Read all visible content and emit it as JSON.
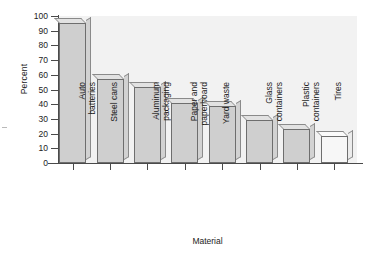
{
  "chart_data": {
    "type": "bar",
    "title": "",
    "subtitle": "",
    "xlabel": "Material",
    "ylabel": "Percent",
    "categories": [
      "Auto batteries",
      "Steel cans",
      "Aluminum packaging",
      "Paper and paperboard",
      "Yard waste",
      "Glass containers",
      "Plastic containers",
      "Tires"
    ],
    "category_lines": [
      [
        "Auto",
        "batteries"
      ],
      [
        "Steel cans"
      ],
      [
        "Aluminum",
        "packaging"
      ],
      [
        "Paper and",
        "paperboard"
      ],
      [
        "Yard waste"
      ],
      [
        "Glass",
        "containers"
      ],
      [
        "Plastic",
        "containers"
      ],
      [
        "Tires"
      ]
    ],
    "values": [
      95,
      57,
      51.5,
      41,
      38.5,
      29,
      23,
      18.5
    ],
    "ylim": [
      0,
      100
    ],
    "yticks": [
      0,
      10,
      20,
      30,
      40,
      50,
      60,
      70,
      80,
      90,
      100
    ],
    "ytick_labels": [
      "0",
      "10",
      "20",
      "30",
      "40",
      "50",
      "60",
      "70",
      "80",
      "90",
      "100"
    ],
    "grid": false,
    "legend": null,
    "legend_position": "none",
    "bar_fill_color": "#cfcfcf",
    "bar_edge_color": "#6e6e6e",
    "plot_background_color": "#f2f2f2",
    "axis_color": "#4a4a4a",
    "unit": "percent",
    "bar_styles": [
      "filled",
      "filled",
      "filled",
      "filled",
      "filled",
      "filled",
      "filled",
      "open"
    ]
  }
}
